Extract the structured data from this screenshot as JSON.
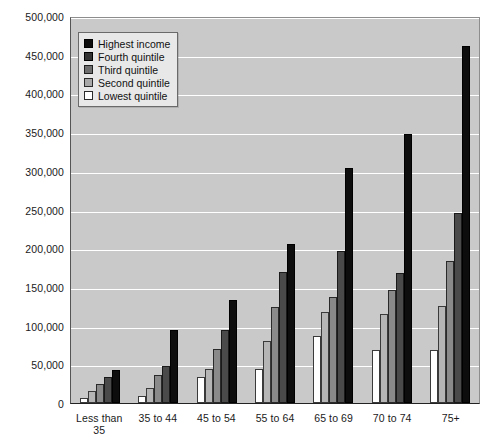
{
  "chart_data": {
    "type": "bar",
    "title": "",
    "subtitle": "",
    "xlabel": "",
    "ylabel": "",
    "ylim": [
      0,
      500000
    ],
    "ytick_step": 50000,
    "grid": true,
    "legend_position": "top-left",
    "orientation": "vertical",
    "grouping": "grouped",
    "categories": [
      "Less than 35",
      "35 to 44",
      "45 to 54",
      "55 to 64",
      "65 to 69",
      "70 to 74",
      "75+"
    ],
    "ytick_labels": [
      "500,000",
      "450,000",
      "400,000",
      "350,000",
      "300,000",
      "250,000",
      "200,000",
      "150,000",
      "100,000",
      "50,000",
      "0"
    ],
    "ytick_values": [
      500000,
      450000,
      400000,
      350000,
      300000,
      250000,
      200000,
      150000,
      100000,
      50000,
      0
    ],
    "series": [
      {
        "name": "Lowest quintile",
        "swatch": "s0",
        "color": "#ffffff",
        "values": [
          7000,
          9000,
          33000,
          44000,
          86000,
          68000,
          68000
        ]
      },
      {
        "name": "Second quintile",
        "swatch": "s1",
        "color": "#b5b5b5",
        "values": [
          16000,
          19000,
          44000,
          80000,
          117000,
          115000,
          125000
        ]
      },
      {
        "name": "Third quintile",
        "swatch": "s2",
        "color": "#8a8a8a",
        "values": [
          24000,
          36000,
          70000,
          124000,
          137000,
          146000,
          184000
        ]
      },
      {
        "name": "Fourth quintile",
        "swatch": "s3",
        "color": "#4a4a4a",
        "values": [
          33000,
          48000,
          94000,
          169000,
          196000,
          168000,
          245000
        ]
      },
      {
        "name": "Highest income",
        "swatch": "s4",
        "color": "#0d0d0d",
        "values": [
          43000,
          94000,
          133000,
          206000,
          303000,
          347000,
          461000
        ]
      }
    ],
    "legend_order": [
      "Highest income",
      "Fourth quintile",
      "Third quintile",
      "Second quintile",
      "Lowest quintile"
    ],
    "plot_background_color": "#c9c9c9",
    "gridline_color": "#ffffff",
    "page_background_color": "#ffffff"
  }
}
